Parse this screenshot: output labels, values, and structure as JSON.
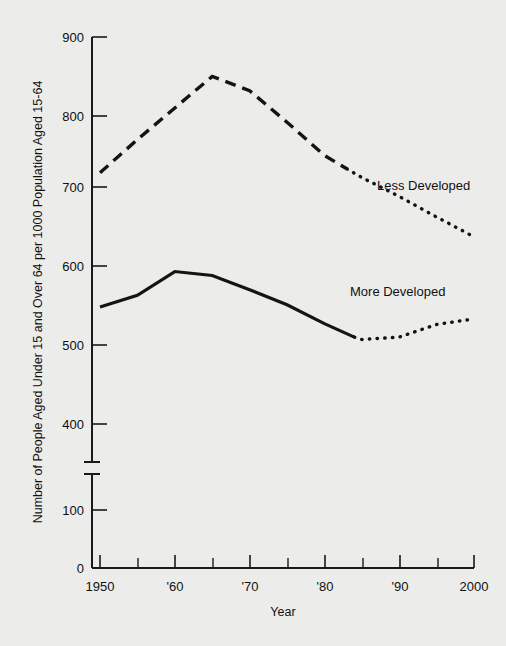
{
  "chart_data": {
    "type": "line",
    "title": "",
    "xlabel": "Year",
    "ylabel": "Number of People Aged Under 15 and Over 64 per 1000 Population Aged 15-64",
    "x": [
      1950,
      1955,
      1960,
      1965,
      1970,
      1975,
      1980,
      1984,
      1985,
      1990,
      1995,
      2000
    ],
    "xlim": [
      1948,
      2002
    ],
    "ylim": [
      0,
      900
    ],
    "y_ticks": [
      0,
      100,
      400,
      500,
      600,
      700,
      800,
      900
    ],
    "y_tick_labels": [
      "0",
      "100",
      "400",
      "500",
      "600",
      "700",
      "800",
      "900"
    ],
    "y_axis_break": {
      "between": [
        100,
        400
      ],
      "present": true
    },
    "x_ticks": [
      1950,
      1955,
      1960,
      1965,
      1970,
      1975,
      1980,
      1985,
      1990,
      1995,
      2000
    ],
    "x_tick_labels": [
      "1950",
      "",
      "'60",
      "",
      "'70",
      "",
      "'80",
      "",
      "'90",
      "",
      "2000"
    ],
    "grid": false,
    "legend": "inline-labels",
    "series": [
      {
        "name": "Less Developed",
        "style": "dashed-then-dotted",
        "projection_starts": 1983,
        "points": [
          {
            "x": 1950,
            "y": 718
          },
          {
            "x": 1955,
            "y": 760
          },
          {
            "x": 1960,
            "y": 800
          },
          {
            "x": 1965,
            "y": 840
          },
          {
            "x": 1970,
            "y": 822
          },
          {
            "x": 1975,
            "y": 782
          },
          {
            "x": 1980,
            "y": 740
          },
          {
            "x": 1983,
            "y": 723
          },
          {
            "x": 1985,
            "y": 712
          },
          {
            "x": 1990,
            "y": 688
          },
          {
            "x": 1995,
            "y": 662
          },
          {
            "x": 2000,
            "y": 637
          }
        ]
      },
      {
        "name": "More Developed",
        "style": "solid-then-dotted",
        "projection_starts": 1984,
        "points": [
          {
            "x": 1950,
            "y": 548
          },
          {
            "x": 1955,
            "y": 563
          },
          {
            "x": 1960,
            "y": 593
          },
          {
            "x": 1965,
            "y": 588
          },
          {
            "x": 1970,
            "y": 570
          },
          {
            "x": 1975,
            "y": 551
          },
          {
            "x": 1980,
            "y": 527
          },
          {
            "x": 1984,
            "y": 510
          },
          {
            "x": 1985,
            "y": 507
          },
          {
            "x": 1990,
            "y": 510
          },
          {
            "x": 1995,
            "y": 526
          },
          {
            "x": 2000,
            "y": 533
          }
        ]
      }
    ],
    "annotations": [
      {
        "text": "Less Developed",
        "x": 1984,
        "y": 738
      },
      {
        "text": "More Developed",
        "x": 1980,
        "y": 570
      }
    ]
  },
  "axis": {
    "y_title": "Number of People Aged Under 15 and Over 64 per 1000 Population Aged 15-64",
    "x_title": "Year",
    "y_labels": {
      "t900": "900",
      "t800": "800",
      "t700": "700",
      "t600": "600",
      "t500": "500",
      "t400": "400",
      "t100": "100",
      "t0": "0"
    },
    "x_labels": {
      "x1950": "1950",
      "x1960": "'60",
      "x1970": "'70",
      "x1980": "'80",
      "x1990": "'90",
      "x2000": "2000"
    }
  },
  "series_labels": {
    "less_developed": "Less Developed",
    "more_developed": "More Developed"
  },
  "colors": {
    "background": "#ececeb",
    "ink": "#141414"
  }
}
